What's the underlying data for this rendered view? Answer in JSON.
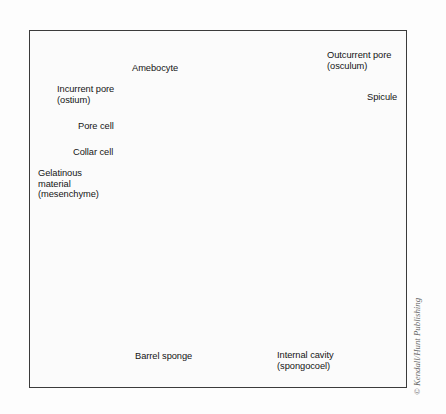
{
  "figure": {
    "credit": "© Kendall/Hunt Publishing",
    "frame": {
      "border_color": "#3b3b3b",
      "background": "#fbfbfb"
    },
    "palette": {
      "page_background": "#fdfdfd",
      "body_light": "#d8d6d2",
      "body_mid": "#b9b6b1",
      "body_shadow": "#8e8b86",
      "cavity_dark": "#6e6d6b",
      "cavity_darker": "#565553",
      "ostia_dot": "#3a3a39",
      "leader_line": "#2a2a2a",
      "label_text": "#141414",
      "credit_text": "#6a6a6a",
      "arrow_gray": "#9a9894",
      "collar_white": "#f2efe9"
    }
  },
  "labels": [
    {
      "id": "amebocyte",
      "text": "Amebocyte",
      "x": 132,
      "y": 68,
      "align": "left"
    },
    {
      "id": "incurrent-pore",
      "text": "Incurrent pore\n(ostium)",
      "x": 57,
      "y": 89,
      "align": "left"
    },
    {
      "id": "pore-cell",
      "text": "Pore cell",
      "x": 78,
      "y": 126,
      "align": "left"
    },
    {
      "id": "collar-cell",
      "text": "Collar cell",
      "x": 73,
      "y": 152,
      "align": "left"
    },
    {
      "id": "gelatinous",
      "text": "Gelatinous\nmaterial\n(mesenchyme)",
      "x": 38,
      "y": 174,
      "align": "left"
    },
    {
      "id": "outcurrent-pore",
      "text": "Outcurrent pore\n(osculum)",
      "x": 327,
      "y": 55,
      "align": "left"
    },
    {
      "id": "spicule",
      "text": "Spicule",
      "x": 367,
      "y": 96,
      "align": "left"
    },
    {
      "id": "barrel-sponge",
      "text": "Barrel sponge",
      "x": 135,
      "y": 355,
      "align": "left"
    },
    {
      "id": "internal-cavity",
      "text": "Internal cavity\n(spongocoel)",
      "x": 277,
      "y": 354,
      "align": "left"
    }
  ],
  "leader_lines": [
    {
      "id": "amebocyte-leader",
      "from": [
        185,
        76
      ],
      "to": [
        214,
        103
      ]
    },
    {
      "id": "incurrent-upper-leader",
      "from": [
        142,
        92
      ],
      "to": [
        186,
        101
      ]
    },
    {
      "id": "incurrent-lower-leader",
      "from": [
        142,
        95
      ],
      "to": [
        192,
        120
      ]
    },
    {
      "id": "pore-cell-leader",
      "from": [
        117,
        128
      ],
      "to": [
        196,
        146
      ]
    },
    {
      "id": "collar-cell-leader",
      "from": [
        115,
        154
      ],
      "to": [
        185,
        172
      ]
    },
    {
      "id": "gelatinous-leader",
      "from": [
        120,
        196
      ],
      "to": [
        160,
        208
      ]
    },
    {
      "id": "osculum-leader",
      "from": [
        325,
        66
      ],
      "to": [
        300,
        84
      ]
    },
    {
      "id": "spicule-leader",
      "from": [
        364,
        100
      ],
      "to": [
        318,
        118
      ]
    },
    {
      "id": "internal-cavity-leader",
      "from": [
        290,
        350
      ],
      "to": [
        300,
        262
      ]
    },
    {
      "id": "right-pointer",
      "from": [
        380,
        166
      ],
      "to": [
        341,
        166
      ]
    }
  ],
  "anatomy": {
    "arrow": {
      "name": "water-outflow-arrow",
      "direction": "up",
      "x": 286,
      "top": 44,
      "bottom": 240
    },
    "cavity": {
      "name": "spongocoel",
      "ostia_rows": 11,
      "ostia_per_row": 6
    },
    "barrel_tubes": [
      {
        "id": "tube-left",
        "x": 52,
        "y": 236,
        "w": 30,
        "h": 110
      },
      {
        "id": "tube-center",
        "x": 78,
        "y": 212,
        "w": 46,
        "h": 148
      },
      {
        "id": "tube-right",
        "x": 108,
        "y": 240,
        "w": 44,
        "h": 132
      }
    ],
    "surface_ostia": [
      [
        207,
        295
      ],
      [
        276,
        310
      ],
      [
        166,
        325
      ],
      [
        238,
        345
      ],
      [
        282,
        288
      ],
      [
        346,
        300
      ],
      [
        338,
        345
      ],
      [
        188,
        352
      ],
      [
        120,
        318
      ]
    ]
  }
}
